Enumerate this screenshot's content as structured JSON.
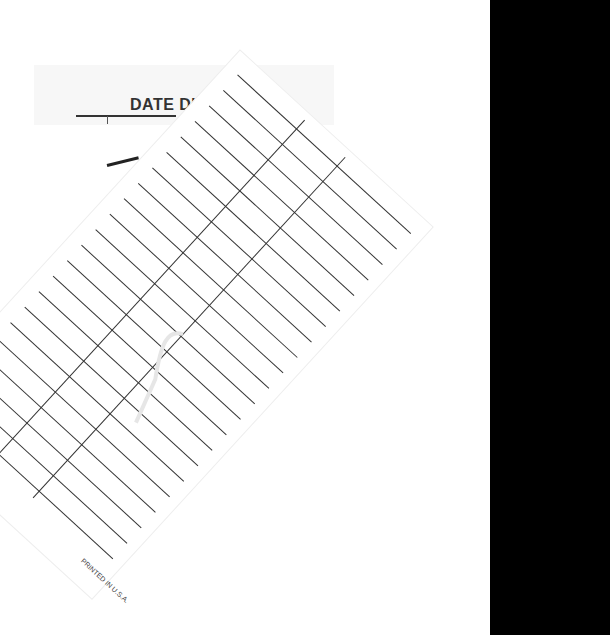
{
  "document": {
    "type": "library date due card scan",
    "background_card": {
      "header": "DATE DU",
      "header_full_hidden": false
    },
    "slip": {
      "brand": "GAYLORD",
      "imprint": "PRINTED IN U.S.A.",
      "columns": 3,
      "ruled_rows": 22
    },
    "colors": {
      "paper": "#ffffff",
      "ink": "#333333",
      "scanner_edge": "#000000"
    }
  }
}
